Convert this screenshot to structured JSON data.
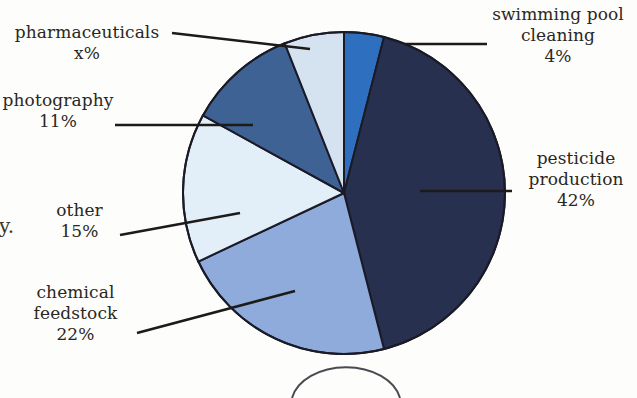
{
  "figure": {
    "type": "pie-chart",
    "page_text_fragment": "y.",
    "center": {
      "x": 344,
      "y": 193
    },
    "radius": 161
  },
  "chart_data": {
    "type": "pie",
    "title": "",
    "xlabel": "",
    "ylabel": "",
    "grid": false,
    "legend_position": "callout-labels",
    "start_angle_deg": 0,
    "direction": "clockwise",
    "categories": [
      "swimming pool cleaning",
      "pesticide production",
      "chemical feedstock",
      "other",
      "photography",
      "pharmaceuticals"
    ],
    "values": [
      4,
      42,
      22,
      15,
      11,
      6
    ],
    "value_labels": [
      "4%",
      "42%",
      "22%",
      "15%",
      "11%",
      "x%"
    ],
    "colors": [
      "#2f6fc0",
      "#28304f",
      "#8fabdb",
      "#e2eef8",
      "#3f6294",
      "#d5e3f0"
    ],
    "slices": [
      {
        "name": "swimming pool cleaning",
        "label": "swimming pool",
        "label_line2": "cleaning",
        "percent": "4%",
        "value": 4,
        "color": "#2f6fc0",
        "start_deg": 0,
        "end_deg": 14.4
      },
      {
        "name": "pesticide production",
        "label": "pesticide",
        "label_line2": "production",
        "percent": "42%",
        "value": 42,
        "color": "#28304f",
        "start_deg": 14.4,
        "end_deg": 165.6
      },
      {
        "name": "chemical feedstock",
        "label": "chemical",
        "label_line2": "feedstock",
        "percent": "22%",
        "value": 22,
        "color": "#8fabdb",
        "start_deg": 165.6,
        "end_deg": 244.8
      },
      {
        "name": "other",
        "label": "other",
        "label_line2": "",
        "percent": "15%",
        "value": 15,
        "color": "#e2eef8",
        "start_deg": 244.8,
        "end_deg": 298.8
      },
      {
        "name": "photography",
        "label": "photography",
        "label_line2": "",
        "percent": "11%",
        "value": 11,
        "color": "#3f6294",
        "start_deg": 298.8,
        "end_deg": 338.4
      },
      {
        "name": "pharmaceuticals",
        "label": "pharmaceuticals",
        "label_line2": "",
        "percent": "x%",
        "value": 6,
        "color": "#d5e3f0",
        "start_deg": 338.4,
        "end_deg": 360
      }
    ],
    "outline_color": "#1b1b28"
  },
  "labels": {
    "pharmaceuticals": {
      "name": "pharmaceuticals",
      "percent": "x%"
    },
    "photography": {
      "name": "photography",
      "percent": "11%"
    },
    "other": {
      "name": "other",
      "percent": "15%"
    },
    "chemical_feedstock": {
      "line1": "chemical",
      "line2": "feedstock",
      "percent": "22%"
    },
    "swimming_pool": {
      "line1": "swimming pool",
      "line2": "cleaning",
      "percent": "4%"
    },
    "pesticide": {
      "line1": "pesticide",
      "line2": "production",
      "percent": "42%"
    }
  }
}
